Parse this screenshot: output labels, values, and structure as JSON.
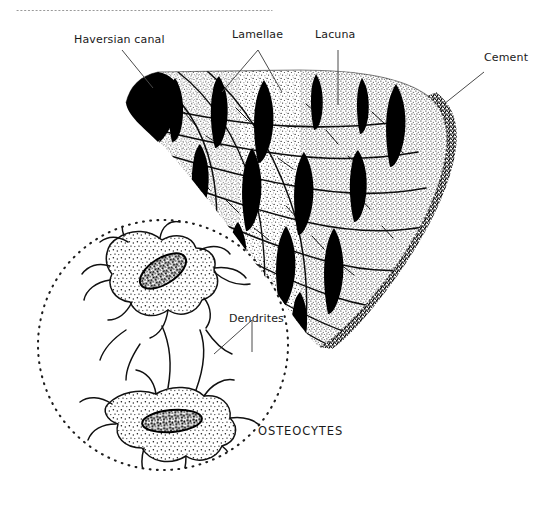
{
  "figure": {
    "background_color": "#ffffff",
    "ink_color": "#161616",
    "width": 543,
    "height": 507
  },
  "labels": {
    "haversian_canal": "Haversian canal",
    "lamellae": "Lamellae",
    "lacuna": "Lacuna",
    "cement": "Cement",
    "dendrites": "Dendrites",
    "osteocytes": "OSTEOCYTES"
  },
  "structures": {
    "haversian_canal": {
      "name": "haversian-canal",
      "description": "Large solid black crescent at the inner apex of the bone wedge",
      "fill": "#000000"
    },
    "bone_wedge": {
      "name": "bone-wedge",
      "description": "Fan-shaped block of lamellar compact bone, stippled texture with concentric wavy lamellae",
      "lamellae_count": 9,
      "lacunae_count": 14,
      "lacuna_fill": "#000000"
    },
    "cement_line": {
      "name": "cement-line",
      "description": "Dense dark stippled band along the outer convex border of the wedge"
    },
    "osteocyte_inset": {
      "name": "osteocyte-inset",
      "description": "Dotted circular magnification showing two stellate osteocytes joined by dendritic processes",
      "cell_count": 2,
      "boundary_style": "dotted-circle"
    }
  },
  "top_rule": {
    "name": "top-dotted-rule",
    "style": "fine dotted horizontal rule near the top margin"
  }
}
